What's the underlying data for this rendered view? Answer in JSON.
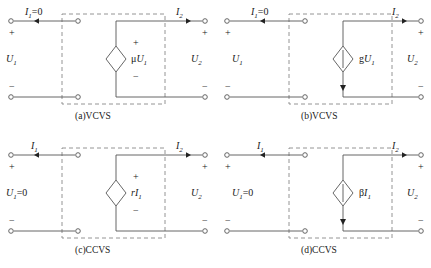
{
  "figure": {
    "background": "#ffffff",
    "line_color": "#555555",
    "dash_color": "#888888",
    "text_color": "#1a1a1a"
  },
  "panels": [
    {
      "id": "a",
      "caption": "(a)VCVS",
      "left_current": "I",
      "left_current_sub": "1",
      "left_current_suffix": "=0",
      "right_current": "I",
      "right_current_sub": "2",
      "left_voltage": "U",
      "left_voltage_sub": "1",
      "left_voltage_suffix": "",
      "right_voltage": "U",
      "right_voltage_sub": "2",
      "source_type": "voltage",
      "source_label_prefix": "μ",
      "source_label_main": "U",
      "source_label_sub": "1",
      "plus": "+",
      "minus": "−"
    },
    {
      "id": "b",
      "caption": "(b)VCVS",
      "left_current": "I",
      "left_current_sub": "1",
      "left_current_suffix": "=0",
      "right_current": "I",
      "right_current_sub": "2",
      "left_voltage": "U",
      "left_voltage_sub": "1",
      "left_voltage_suffix": "",
      "right_voltage": "U",
      "right_voltage_sub": "2",
      "source_type": "current",
      "source_label_prefix": "g",
      "source_label_main": "U",
      "source_label_sub": "1",
      "plus": "+",
      "minus": "−"
    },
    {
      "id": "c",
      "caption": "(c)CCVS",
      "left_current": "I",
      "left_current_sub": "1",
      "left_current_suffix": "",
      "right_current": "I",
      "right_current_sub": "2",
      "left_voltage": "U",
      "left_voltage_sub": "1",
      "left_voltage_suffix": "=0",
      "right_voltage": "U",
      "right_voltage_sub": "2",
      "source_type": "voltage",
      "source_label_prefix": "r",
      "source_label_main": "I",
      "source_label_sub": "1",
      "plus": "+",
      "minus": "−"
    },
    {
      "id": "d",
      "caption": "(d)CCVS",
      "left_current": "I",
      "left_current_sub": "1",
      "left_current_suffix": "",
      "right_current": "I",
      "right_current_sub": "2",
      "left_voltage": "U",
      "left_voltage_sub": "1",
      "left_voltage_suffix": "=0",
      "right_voltage": "U",
      "right_voltage_sub": "2",
      "source_type": "current",
      "source_label_prefix": "β",
      "source_label_main": "I",
      "source_label_sub": "1",
      "plus": "+",
      "minus": "−"
    }
  ]
}
